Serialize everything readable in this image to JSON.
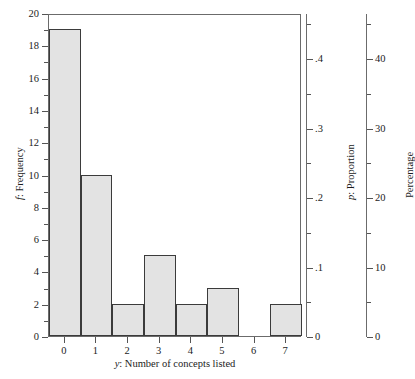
{
  "chart_data": {
    "type": "bar",
    "title": "",
    "subtitle": "",
    "xlabel": "y: Number of concepts listed",
    "ylabel": "f: Frequency",
    "categories": [
      "0",
      "1",
      "2",
      "3",
      "4",
      "5",
      "6",
      "7"
    ],
    "values": [
      19,
      10,
      2,
      5,
      2,
      3,
      0,
      2
    ],
    "ylim": [
      0,
      20
    ],
    "xlim": [
      -0.5,
      7.5
    ],
    "grid": false,
    "legend": null,
    "bar_fill_color": "#e3e3e3",
    "bar_edge_color": "#3b3b3b",
    "axis_color": "#6b6b6b",
    "n_total": 43,
    "axes": {
      "left": {
        "label": "f: Frequency",
        "label_prefix_italic": "f",
        "label_rest": ": Frequency",
        "ticks": [
          "0",
          "2",
          "4",
          "6",
          "8",
          "10",
          "12",
          "14",
          "16",
          "18",
          "20"
        ],
        "tick_values": [
          0,
          2,
          4,
          6,
          8,
          10,
          12,
          14,
          16,
          18,
          20
        ],
        "minor_tick_values": [
          1,
          3,
          5,
          7,
          9,
          11,
          13,
          15,
          17,
          19
        ],
        "range": [
          0,
          20
        ]
      },
      "right_proportion": {
        "label": "p: Proportion",
        "label_prefix_italic": "p",
        "label_rest": ": Proportion",
        "ticks": [
          "0",
          ".1",
          ".2",
          ".3",
          ".4"
        ],
        "tick_values": [
          0,
          0.1,
          0.2,
          0.3,
          0.4
        ],
        "minor_tick_values": [
          0.05,
          0.15,
          0.25,
          0.35,
          0.45
        ],
        "range": [
          0,
          0.465
        ]
      },
      "right_percentage": {
        "label": "Percentage",
        "ticks": [
          "0",
          "10",
          "20",
          "30",
          "40"
        ],
        "tick_values": [
          0,
          10,
          20,
          30,
          40
        ],
        "minor_tick_values": [
          5,
          15,
          25,
          35,
          45
        ],
        "range": [
          0,
          46.5
        ]
      },
      "bottom": {
        "label": "y: Number of concepts listed",
        "label_prefix_italic": "y",
        "label_rest": ": Number of concepts listed",
        "ticks": [
          "0",
          "1",
          "2",
          "3",
          "4",
          "5",
          "6",
          "7"
        ],
        "tick_values": [
          0,
          1,
          2,
          3,
          4,
          5,
          6,
          7
        ],
        "range": [
          -0.5,
          7.5
        ]
      }
    }
  }
}
